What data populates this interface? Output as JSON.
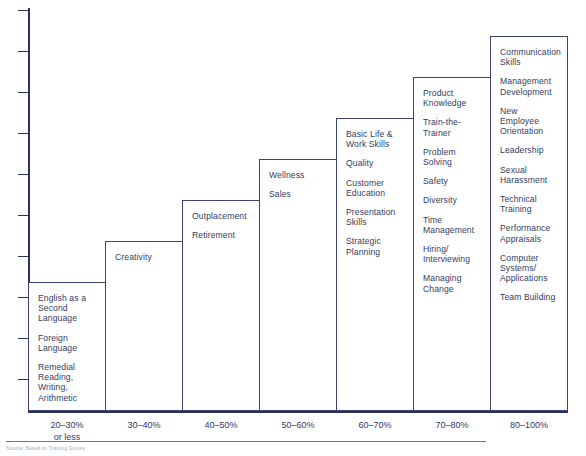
{
  "chart_data": {
    "type": "bar",
    "title": "",
    "xlabel": "",
    "ylabel": "",
    "grid": false,
    "legend": "none",
    "categories": [
      "20–30%\nor less",
      "30–40%",
      "40–50%",
      "50–60%",
      "60–70%",
      "70–80%",
      "80–100%"
    ],
    "values": [
      1,
      2,
      3,
      4,
      5,
      6,
      7
    ],
    "axis_ticks": 9,
    "series": [
      {
        "name": "Percent of organizations providing training",
        "values": [
          1,
          2,
          3,
          4,
          5,
          6,
          7
        ]
      }
    ],
    "bars": [
      {
        "category": "20–30%",
        "category_line2": "or less",
        "height_steps": 1,
        "items": [
          "English as a Second Language",
          "Foreign Language",
          "Remedial Reading, Writing, Arithmetic"
        ]
      },
      {
        "category": "30–40%",
        "category_line2": "",
        "height_steps": 2,
        "items": [
          "Creativity"
        ]
      },
      {
        "category": "40–50%",
        "category_line2": "",
        "height_steps": 3,
        "items": [
          "Outplacement",
          "Retirement"
        ]
      },
      {
        "category": "50–60%",
        "category_line2": "",
        "height_steps": 4,
        "items": [
          "Wellness",
          "Sales"
        ]
      },
      {
        "category": "60–70%",
        "category_line2": "",
        "height_steps": 5,
        "items": [
          "Basic Life & Work Skills",
          "Quality",
          "Customer Education",
          "Presentation Skills",
          "Strategic Planning"
        ]
      },
      {
        "category": "70–80%",
        "category_line2": "",
        "height_steps": 6,
        "items": [
          "Product Knowledge",
          "Train-the-Trainer",
          "Problem Solving",
          "Safety",
          "Diversity",
          "Time Management",
          "Hiring/ Interviewing",
          "Managing Change"
        ]
      },
      {
        "category": "80–100%",
        "category_line2": "",
        "height_steps": 7,
        "items": [
          "Communication Skills",
          "Management Development",
          "New Employee Orientation",
          "Leadership",
          "Sexual Harassment",
          "Technical Training",
          "Performance Appraisals",
          "Computer Systems/ Applications",
          "Team Building"
        ]
      }
    ]
  },
  "footer": {
    "source": "Source: Based on Training Survey."
  },
  "colors": {
    "axis": "#2b3356",
    "bar_border": "#3b4570",
    "text": "#333c63",
    "bar_fill": "#ffffff"
  }
}
